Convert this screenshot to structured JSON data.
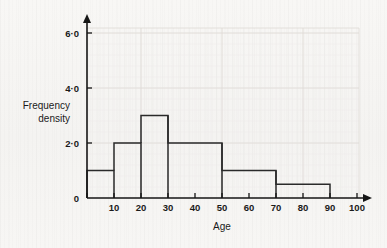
{
  "figure": {
    "background_color": "#f7f6f4",
    "ink_color": "#1a1a1a",
    "bar_stroke_color": "#2a2a2a",
    "grid_color": "#dedbd6"
  },
  "labels": {
    "y_axis_line1": "Frequency",
    "y_axis_line2": "density",
    "x_axis_title": "Age"
  },
  "y_ticks": [
    {
      "value": 0,
      "label": "0"
    },
    {
      "value": 2,
      "label": "2·0"
    },
    {
      "value": 4,
      "label": "4·0"
    },
    {
      "value": 6,
      "label": "6·0"
    }
  ],
  "x_ticks": [
    {
      "value": 0,
      "label": ""
    },
    {
      "value": 10,
      "label": "10"
    },
    {
      "value": 20,
      "label": "20"
    },
    {
      "value": 30,
      "label": "30"
    },
    {
      "value": 40,
      "label": "40"
    },
    {
      "value": 50,
      "label": "50"
    },
    {
      "value": 60,
      "label": "60"
    },
    {
      "value": 70,
      "label": "70"
    },
    {
      "value": 80,
      "label": "80"
    },
    {
      "value": 90,
      "label": "90"
    },
    {
      "value": 100,
      "label": "100"
    }
  ],
  "chart_data": {
    "type": "bar",
    "title": "",
    "subtitle": "",
    "xlabel": "Age",
    "ylabel": "Frequency density",
    "xlim": [
      0,
      100
    ],
    "ylim": [
      0,
      6.6
    ],
    "grid": true,
    "legend": false,
    "bin_edges": [
      0,
      10,
      20,
      30,
      50,
      70,
      90
    ],
    "bars": [
      {
        "x_start": 0,
        "x_end": 10,
        "height": 1,
        "width": 10,
        "frequency": 10
      },
      {
        "x_start": 10,
        "x_end": 20,
        "height": 2,
        "width": 10,
        "frequency": 20
      },
      {
        "x_start": 20,
        "x_end": 30,
        "height": 3,
        "width": 10,
        "frequency": 30
      },
      {
        "x_start": 30,
        "x_end": 50,
        "height": 2,
        "width": 20,
        "frequency": 40
      },
      {
        "x_start": 50,
        "x_end": 70,
        "height": 1,
        "width": 20,
        "frequency": 20
      },
      {
        "x_start": 70,
        "x_end": 90,
        "height": 0.5,
        "width": 20,
        "frequency": 10
      }
    ],
    "categories": [
      "0-10",
      "10-20",
      "20-30",
      "30-50",
      "50-70",
      "70-90"
    ],
    "values": [
      1,
      2,
      3,
      2,
      1,
      0.5
    ],
    "x_tick_values": [
      0,
      10,
      20,
      30,
      40,
      50,
      60,
      70,
      80,
      90,
      100
    ],
    "y_tick_values": [
      0,
      2,
      4,
      6
    ],
    "y_tick_labels": [
      "0",
      "2·0",
      "4·0",
      "6·0"
    ]
  }
}
